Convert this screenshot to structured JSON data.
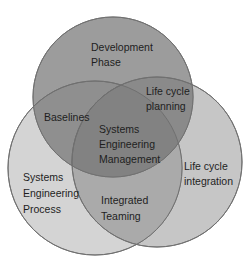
{
  "diagram": {
    "type": "venn",
    "sets": [
      {
        "id": "development",
        "label_lines": [
          "Development",
          "Phase"
        ],
        "color": "#9a9a9a"
      },
      {
        "id": "process",
        "label_lines": [
          "Systems",
          "Engineering",
          "Process"
        ],
        "color": "#d2d2d2"
      },
      {
        "id": "integration",
        "label_lines": [
          "Life cycle",
          "integration"
        ],
        "color": "#c4c4c4"
      }
    ],
    "intersections": [
      {
        "id": "baselines",
        "sets": [
          "development",
          "process"
        ],
        "label_lines": [
          "Baselines"
        ]
      },
      {
        "id": "planning",
        "sets": [
          "development",
          "integration"
        ],
        "label_lines": [
          "Life cycle",
          "planning"
        ]
      },
      {
        "id": "teaming",
        "sets": [
          "process",
          "integration"
        ],
        "label_lines": [
          "Integrated",
          "Teaming"
        ]
      },
      {
        "id": "center",
        "sets": [
          "development",
          "process",
          "integration"
        ],
        "label_lines": [
          "Systems",
          "Engineering",
          "Management"
        ]
      }
    ]
  }
}
